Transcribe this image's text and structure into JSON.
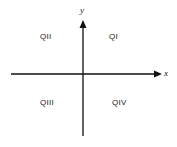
{
  "diagram": {
    "title": "",
    "axes": {
      "x_label": "x",
      "y_label": "y",
      "color": "#111111"
    },
    "quadrants": [
      {
        "id": "q1",
        "label": "QI"
      },
      {
        "id": "q2",
        "label": "QII"
      },
      {
        "id": "q3",
        "label": "QIII"
      },
      {
        "id": "q4",
        "label": "QIV"
      }
    ]
  }
}
